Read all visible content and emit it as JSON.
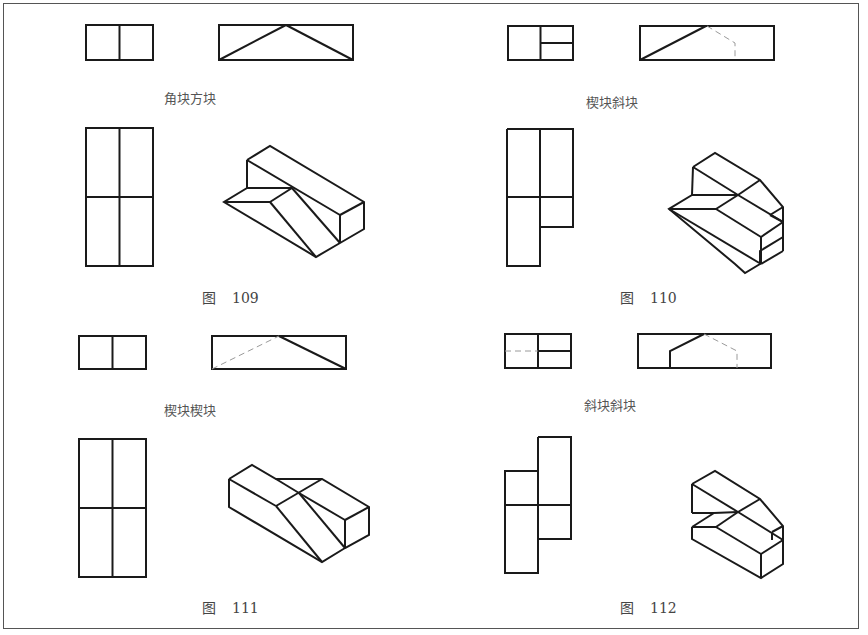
{
  "figures": [
    {
      "id": "109",
      "caption_prefix": "图",
      "caption_number": "109",
      "label": "角块方块"
    },
    {
      "id": "110",
      "caption_prefix": "图",
      "caption_number": "110",
      "label": "楔块斜块"
    },
    {
      "id": "111",
      "caption_prefix": "图",
      "caption_number": "111",
      "label": "楔块楔块"
    },
    {
      "id": "112",
      "caption_prefix": "图",
      "caption_number": "112",
      "label": "斜块斜块"
    }
  ],
  "colors": {
    "line": "#1a1a1a",
    "hidden_line": "#9a9a9a",
    "frame": "#555555",
    "text": "#555555"
  }
}
